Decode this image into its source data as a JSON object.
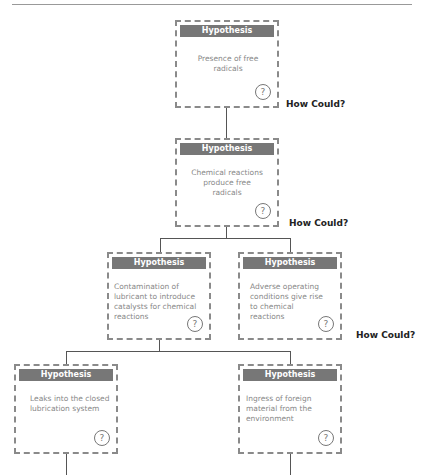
{
  "page_header": {
    "text": "ROOT CAUSE ANALYSIS",
    "page_number": "15"
  },
  "node_title": "Hypothesis",
  "question_icon": "?",
  "nodes": [
    {
      "id": "n1",
      "text": "Presence of free radicals"
    },
    {
      "id": "n2",
      "text": "Chemical reactions produce free radicals"
    },
    {
      "id": "n3",
      "text": "Contamination of lubricant to introduce catalysts for chemical reactions"
    },
    {
      "id": "n4",
      "text": "Adverse operating conditions give rise to chemical reactions"
    },
    {
      "id": "n5",
      "text": "Leaks into the closed lubrication system"
    },
    {
      "id": "n6",
      "text": "Ingress of foreign material from the environment"
    }
  ],
  "how_could_labels": [
    "How Could?",
    "How Could?",
    "How Could?"
  ]
}
